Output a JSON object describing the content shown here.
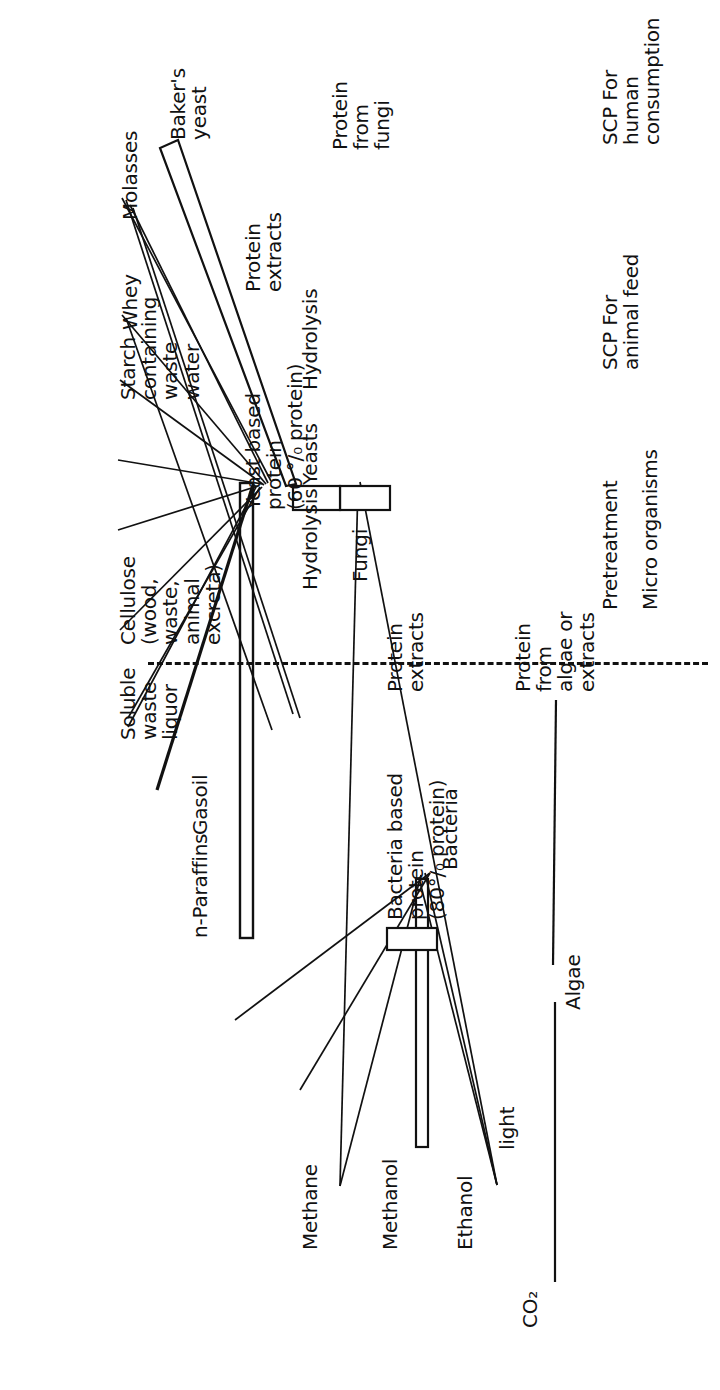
{
  "figure": {
    "type": "process-flow-diagram",
    "orientation": "rotated-90-ccw",
    "line_color": "#111111",
    "background": "#ffffff",
    "divider": {
      "style": "dash-dot",
      "label": ""
    }
  },
  "row_labels": [
    {
      "id": "pretreatment",
      "text": "Pretreatment"
    },
    {
      "id": "micro-organisms",
      "text": "Micro organisms"
    },
    {
      "id": "scp-animal-feed",
      "text": "SCP For\nanimal  feed"
    },
    {
      "id": "scp-human",
      "text": "SCP For human\nconsumption"
    }
  ],
  "substrates": [
    {
      "id": "co2",
      "text": "CO₂"
    },
    {
      "id": "ethanol",
      "text": "Ethanol"
    },
    {
      "id": "methanol",
      "text": "Methanol"
    },
    {
      "id": "methane",
      "text": "Methane"
    },
    {
      "id": "n-paraffins",
      "text": "n-Paraffins"
    },
    {
      "id": "gasoil",
      "text": "Gasoil"
    },
    {
      "id": "soluble-waste-liquor",
      "text": "Soluble\nwaste\nliquor"
    },
    {
      "id": "cellulose",
      "text": "Cellulose\n(wood,\nwaste,\nanimal\nexcreta)"
    },
    {
      "id": "starch-waste-water",
      "text": "Starch\ncontaining\nwaste\nwater"
    },
    {
      "id": "whey",
      "text": "Whey"
    },
    {
      "id": "molasses",
      "text": "Molasses"
    }
  ],
  "processes": [
    {
      "id": "light",
      "text": "light"
    },
    {
      "id": "hydrolysis-cellulose",
      "text": "Hydrolysis"
    },
    {
      "id": "hydrolysis-starch",
      "text": "Hydrolysis"
    }
  ],
  "organisms": [
    {
      "id": "algae",
      "text": "Algae"
    },
    {
      "id": "bacteria",
      "text": "Bacteria"
    },
    {
      "id": "yeasts",
      "text": "Yeasts"
    },
    {
      "id": "fungi",
      "text": "Fungi"
    }
  ],
  "products": [
    {
      "id": "bacteria-based-protein",
      "text": "Bacteria based\nprotein\n(80°/₀ protein)",
      "protein_pct": 80
    },
    {
      "id": "yeast-based-protein",
      "text": "Yeast based\nprotein\n(60 °/₀ protein)",
      "protein_pct": 60
    },
    {
      "id": "bakers-yeast",
      "text": "Baker's\nyeast"
    },
    {
      "id": "protein-from-fungi",
      "text": "Protein\nfrom\nfungi"
    }
  ],
  "human_products": [
    {
      "id": "protein-from-algae-or-extracts",
      "text": "Protein\nfrom\nalgae or\nextracts"
    },
    {
      "id": "protein-extracts-bacteria",
      "text": "Protein\nextracts"
    },
    {
      "id": "protein-extracts-yeast",
      "text": "Protein\nextracts"
    }
  ]
}
